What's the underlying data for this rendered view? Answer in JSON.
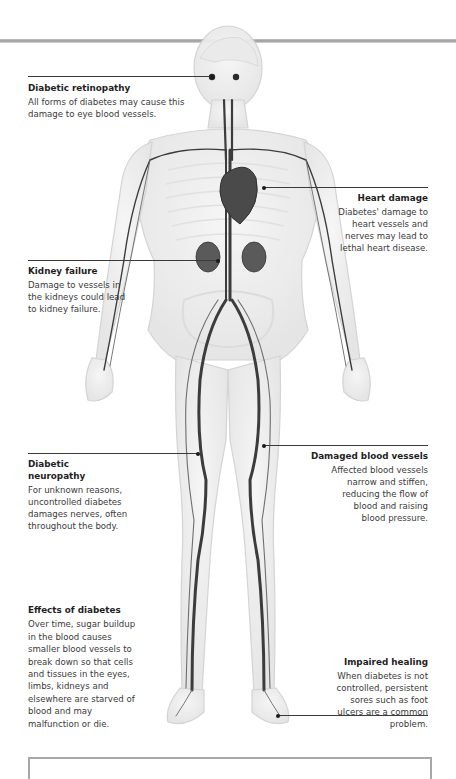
{
  "diagram": {
    "colors": {
      "vessel": "#3c3c3c",
      "body_outline": "#d6d6d6",
      "rule": "#a8a8a8",
      "leader": "#3a3a3a"
    }
  },
  "annotations": [
    {
      "id": "retinopathy",
      "title": "Diabetic retinopathy",
      "body": "All forms of diabetes may cause this damage to eye blood vessels."
    },
    {
      "id": "heart",
      "title": "Heart damage",
      "body": "Diabetes' damage to heart vessels and nerves may lead to lethal heart disease."
    },
    {
      "id": "kidney",
      "title": "Kidney failure",
      "body": "Damage to vessels in the kidneys could lead to kidney failure."
    },
    {
      "id": "neuropathy",
      "title": "Diabetic neuropathy",
      "body": "For unknown reasons, uncontrolled diabetes damages nerves, often throughout the body."
    },
    {
      "id": "vessels",
      "title": "Damaged blood vessels",
      "body": "Affected blood vessels narrow and stiffen, reducing the flow of blood and raising blood pressure."
    },
    {
      "id": "effects",
      "title": "Effects of diabetes",
      "body": "Over time, sugar buildup in the blood causes smaller blood vessels to break down so that cells and tissues in the eyes, limbs, kidneys and elsewhere are starved of blood and may malfunction or die."
    },
    {
      "id": "healing",
      "title": "Impaired healing",
      "body": "When diabetes is not controlled, persistent sores such as foot ulcers are a common problem."
    }
  ]
}
